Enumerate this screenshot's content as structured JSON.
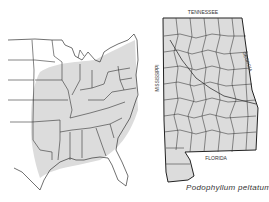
{
  "figure": {
    "caption": "Podophyllum peltatum",
    "colors": {
      "shade": "#dcdcdc",
      "line": "#333333",
      "background": "#ffffff"
    }
  },
  "us_map": {
    "description": "Eastern United States with shaded species range"
  },
  "alabama_map": {
    "labels": {
      "north": "TENNESSEE",
      "east": "GEORGIA",
      "west": "MISSISSIPPI",
      "south": "FLORIDA"
    },
    "description": "Alabama counties, all shaded"
  }
}
